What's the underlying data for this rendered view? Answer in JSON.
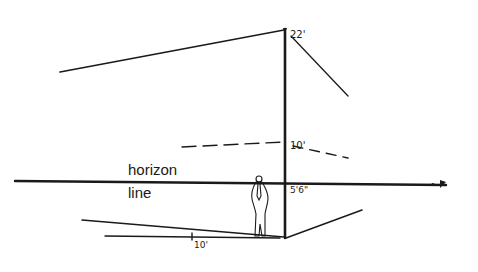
{
  "diagram": {
    "type": "perspective-drawing",
    "labels": {
      "horizon_word1": "horizon",
      "horizon_word2": "line",
      "top_height": "22'",
      "mid_height": "10'",
      "eye_height": "5'6\"",
      "ground_distance": "10'"
    },
    "colors": {
      "ink": "#1a1a1a",
      "background": "#ffffff"
    },
    "elements": [
      "vertical-measuring-post",
      "top-left-receding-line",
      "top-right-receding-line",
      "dashed-10ft-left-line",
      "dashed-10ft-right-line",
      "horizon-line",
      "ground-left-receding-line",
      "ground-distance-line",
      "ground-right-receding-line",
      "standing-person-figure"
    ]
  }
}
